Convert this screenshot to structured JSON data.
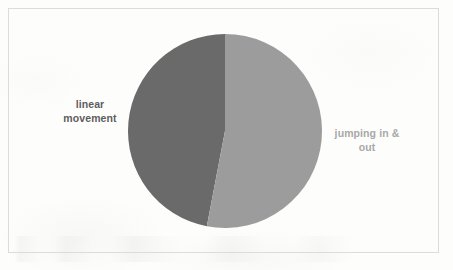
{
  "figure": {
    "background_color": "#fdfdfc",
    "frame_color": "#dcdcdc"
  },
  "chart_data": {
    "type": "pie",
    "title": "",
    "subtitle": "",
    "xlabel": "",
    "ylabel": "",
    "legend_position": "none",
    "grid": false,
    "start_angle_deg": 90,
    "direction": "counterclockwise",
    "labels": [
      "linear movement",
      "jumping in & out"
    ],
    "values": [
      47,
      53
    ],
    "value_unit": "percent",
    "slices": [
      {
        "name": "linear movement",
        "label_line_1": "linear",
        "label_line_2": "movement",
        "label_text": "linear\nmovement",
        "value": 47,
        "angle_deg": 170,
        "color": "#6a6a6a",
        "label_color": "#5e5e5e",
        "label_side": "left"
      },
      {
        "name": "jumping in & out",
        "label_line_1": "jumping in &",
        "label_line_2": "out",
        "label_text": "jumping in &\nout",
        "value": 53,
        "angle_deg": 190,
        "color": "#9c9c9c",
        "label_color": "#a8a8a8",
        "label_side": "right"
      }
    ],
    "geometry": {
      "center_x": 225,
      "center_y": 131,
      "radius": 97
    }
  }
}
